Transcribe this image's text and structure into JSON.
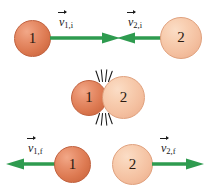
{
  "figure": {
    "background_color": "#ffffff",
    "arrow_color": "#2e9b4f",
    "impact_mark_color": "#1a1a1a",
    "ball_1_color": "#dd7a52",
    "ball_2_color": "#f4c0a0"
  },
  "rows": {
    "before": {
      "name": "before-collision",
      "ball_1": {
        "label": "1"
      },
      "ball_2": {
        "label": "2"
      },
      "vector_1": {
        "symbol": "v",
        "subscript": "1,i",
        "direction": "right"
      },
      "vector_2": {
        "symbol": "v",
        "subscript": "2,i",
        "direction": "left"
      }
    },
    "during": {
      "name": "during-collision",
      "ball_1": {
        "label": "1"
      },
      "ball_2": {
        "label": "2"
      }
    },
    "after": {
      "name": "after-collision",
      "ball_1": {
        "label": "1"
      },
      "ball_2": {
        "label": "2"
      },
      "vector_1": {
        "symbol": "v",
        "subscript": "1,f",
        "direction": "left"
      },
      "vector_2": {
        "symbol": "v",
        "subscript": "2,f",
        "direction": "right"
      }
    }
  }
}
